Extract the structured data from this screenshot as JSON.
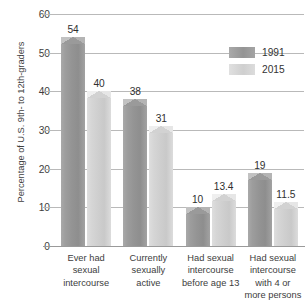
{
  "chart_data": {
    "type": "bar",
    "title": "",
    "xlabel": "",
    "ylabel": "Percentage of U.S. 9th- to 12th-graders",
    "ylim": [
      0,
      60
    ],
    "yticks": [
      0,
      10,
      20,
      30,
      40,
      50,
      60
    ],
    "grid": true,
    "legend_position": "upper right",
    "categories": [
      "Ever had sexual intercourse",
      "Currently sexually active",
      "Had sexual intercourse before age 13",
      "Had sexual intercourse with 4 or more persons"
    ],
    "category_lines": [
      [
        "Ever had",
        "sexual",
        "intercourse"
      ],
      [
        "Currently",
        "sexually",
        "active"
      ],
      [
        "Had sexual",
        "intercourse",
        "before age 13"
      ],
      [
        "Had sexual",
        "intercourse",
        "with 4 or",
        "more persons"
      ]
    ],
    "series": [
      {
        "name": "1991",
        "color": "#949494",
        "values": [
          54,
          38,
          10,
          19
        ],
        "labels": [
          "54",
          "38",
          "10",
          "19"
        ]
      },
      {
        "name": "2015",
        "color": "#d2d2d2",
        "values": [
          40,
          31,
          13.4,
          11.5
        ],
        "labels": [
          "40",
          "31",
          "13.4",
          "11.5"
        ]
      }
    ]
  },
  "axis": {
    "y_title": "Percentage of U.S. 9th- to 12th-graders",
    "y_tick_labels": [
      "60",
      "50",
      "40",
      "30",
      "20",
      "10",
      "0"
    ]
  },
  "legend": {
    "entries": [
      {
        "label": "1991"
      },
      {
        "label": "2015"
      }
    ]
  }
}
